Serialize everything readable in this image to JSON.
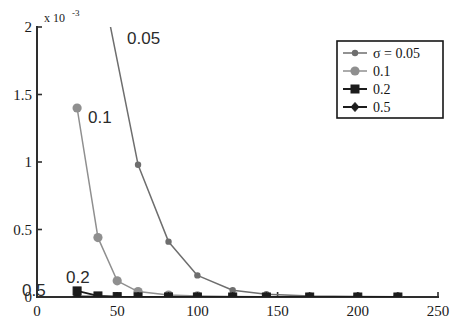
{
  "chart_data": {
    "type": "line",
    "title": "",
    "xlabel": "",
    "ylabel": "",
    "y_axis_exponent_prefix": "x 10",
    "y_axis_exponent_value": "-3",
    "xlim": [
      0,
      250
    ],
    "ylim": [
      0,
      0.002
    ],
    "xticks": [
      0,
      50,
      100,
      150,
      200,
      250
    ],
    "xtick_labels": [
      "0",
      "50",
      "100",
      "150",
      "200",
      "250"
    ],
    "yticks": [
      0,
      0.0005,
      0.001,
      0.0015,
      0.002
    ],
    "ytick_labels": [
      "0",
      "0.5",
      "1",
      "1.5",
      "2"
    ],
    "grid": false,
    "legend_position": "upper-right",
    "series": [
      {
        "name": "sigma = 0.05",
        "legend_label": "σ  = 0.05",
        "marker": "small-circle",
        "color": "#6e6e6e",
        "x": [
          25,
          38,
          45,
          63,
          82,
          100,
          122,
          143,
          170,
          200,
          225
        ],
        "y": [
          0.0075,
          0.0048,
          0.00205,
          0.00098,
          0.00041,
          0.00016,
          5e-05,
          2e-05,
          8e-06,
          4e-06,
          2e-06
        ]
      },
      {
        "name": "sigma = 0.1",
        "legend_label": "0.1",
        "marker": "large-circle",
        "color": "#8f8f8f",
        "x": [
          25,
          38,
          50,
          63,
          82,
          100,
          122,
          143,
          170,
          200,
          225
        ],
        "y": [
          0.0014,
          0.00044,
          0.00012,
          4e-05,
          1.5e-05,
          8e-06,
          4e-06,
          2e-06,
          1e-06,
          5e-07,
          3e-07
        ]
      },
      {
        "name": "sigma = 0.2",
        "legend_label": "0.2",
        "marker": "square",
        "color": "#1c1c1c",
        "x": [
          25,
          38,
          50,
          63,
          82,
          100,
          122,
          143,
          170,
          200,
          225
        ],
        "y": [
          4.5e-05,
          8e-06,
          3e-06,
          1e-06,
          5e-07,
          3e-07,
          2e-07,
          1e-07,
          5e-08,
          3e-08,
          2e-08
        ]
      },
      {
        "name": "sigma = 0.5",
        "legend_label": "0.5",
        "marker": "diamond",
        "color": "#1c1c1c",
        "x": [
          25,
          38,
          50,
          63,
          82,
          100,
          122,
          143,
          170,
          200,
          225
        ],
        "y": [
          4e-06,
          2e-06,
          1e-06,
          8e-07,
          5e-07,
          3e-07,
          2e-07,
          1e-07,
          5e-08,
          3e-08,
          2e-08
        ]
      }
    ],
    "annotations": [
      {
        "text": "0.05",
        "x_px": 127,
        "y_px": 44
      },
      {
        "text": "0.1",
        "x_px": 88,
        "y_px": 123
      },
      {
        "text": "0.2",
        "x_px": 66,
        "y_px": 283
      },
      {
        "text": "0.5",
        "x_px": 22,
        "y_px": 296
      }
    ]
  },
  "legend": {
    "entries": [
      {
        "label": "σ  = 0.05",
        "marker": "small-circle",
        "color": "#6e6e6e"
      },
      {
        "label": "0.1",
        "marker": "large-circle",
        "color": "#8f8f8f"
      },
      {
        "label": "0.2",
        "marker": "square",
        "color": "#1c1c1c"
      },
      {
        "label": "0.5",
        "marker": "diamond",
        "color": "#1c1c1c"
      }
    ]
  },
  "axis": {
    "exponent_prefix": "x 10",
    "exponent_sup": "-3",
    "x_tick_labels": [
      "0",
      "50",
      "100",
      "150",
      "200",
      "250"
    ],
    "y_tick_labels": [
      "0",
      "0.5",
      "1",
      "1.5",
      "2"
    ]
  },
  "colors": {
    "axis": "#2e2e2e",
    "background": "#ffffff",
    "series_005": "#6e6e6e",
    "series_01": "#8f8f8f",
    "series_02": "#1c1c1c",
    "series_05": "#1c1c1c"
  }
}
